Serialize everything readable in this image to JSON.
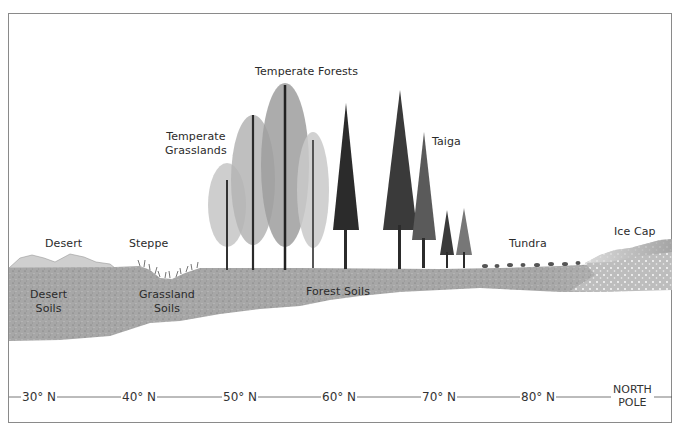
{
  "diagram": {
    "type": "cross-section illustration"
  },
  "biomes": [
    {
      "label": "Desert",
      "x": 68,
      "y": 237
    },
    {
      "label": "Steppe",
      "x": 147,
      "y": 237
    },
    {
      "label": "Temperate Grasslands",
      "line1": "Temperate",
      "line2": "Grasslands"
    },
    {
      "label": "Temperate Forests"
    },
    {
      "label": "Taiga"
    },
    {
      "label": "Tundra"
    },
    {
      "label": "Ice Cap"
    }
  ],
  "labels": {
    "desert": "Desert",
    "steppe": "Steppe",
    "temperate_grasslands_1": "Temperate",
    "temperate_grasslands_2": "Grasslands",
    "temperate_forests": "Temperate Forests",
    "taiga": "Taiga",
    "tundra": "Tundra",
    "ice_cap": "Ice Cap"
  },
  "soils": {
    "desert_1": "Desert",
    "desert_2": "Soils",
    "grassland_1": "Grassland",
    "grassland_2": "Soils",
    "forest": "Forest Soils"
  },
  "latitude_axis": {
    "ticks": [
      "30° N",
      "40° N",
      "50° N",
      "60° N",
      "70° N",
      "80° N"
    ],
    "end_label_1": "NORTH",
    "end_label_2": "POLE"
  },
  "colors": {
    "soil": "#a9a9a9",
    "soil_dark": "#8f8f8f",
    "tree_dark": "#2b2b2b",
    "tree_light": "#7a7a7a",
    "ice": "#d8d8d8",
    "line": "#555555"
  }
}
